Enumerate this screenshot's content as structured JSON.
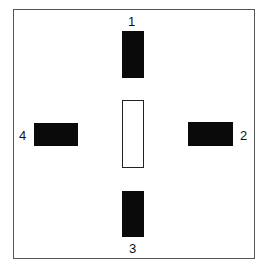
{
  "diagram": {
    "labels": {
      "top": "1",
      "right": "2",
      "bottom": "3",
      "left": "4"
    },
    "colors": {
      "block": "#0a0a0a",
      "frame": "#555555",
      "center_outline": "#222222"
    }
  }
}
